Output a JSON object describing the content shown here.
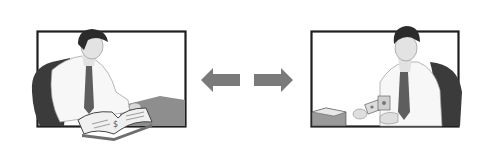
{
  "illustration": {
    "left_panel": {
      "subject": "man-reading-ledger-book",
      "frame": {
        "x": 37,
        "y": 31,
        "w": 148,
        "h": 96
      }
    },
    "right_panel": {
      "subject": "man-handing-cash",
      "frame": {
        "x": 311,
        "y": 31,
        "w": 147,
        "h": 96
      }
    },
    "arrows": [
      {
        "direction": "left",
        "icon": "arrow-left-icon"
      },
      {
        "direction": "right",
        "icon": "arrow-right-icon"
      }
    ],
    "colors": {
      "background": "#ffffff",
      "frame_border": "#1e1e1e",
      "arrow": "#7a7a7a",
      "chair": "#3a3a3a",
      "desk": "#8c8c8c",
      "tie": "#5e5e5e",
      "hair": "#2a2a2a",
      "skin": "#e2e2e2",
      "shirt": "#f6f6f6"
    }
  }
}
